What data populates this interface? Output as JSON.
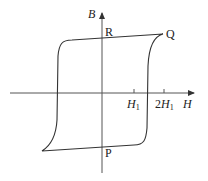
{
  "diagram": {
    "type": "hysteresis-loop",
    "axes": {
      "y_label": "B",
      "x_label": "H"
    },
    "ticks": [
      {
        "base": "H",
        "sub": "1",
        "prefix": "",
        "position": "H1"
      },
      {
        "base": "H",
        "sub": "1",
        "prefix": "2",
        "position": "2H1"
      }
    ],
    "points": {
      "R": "R",
      "Q": "Q",
      "P": "P"
    },
    "colors": {
      "line": "#333333",
      "axis": "#555555",
      "text": "#222222",
      "background": "#ffffff"
    }
  }
}
